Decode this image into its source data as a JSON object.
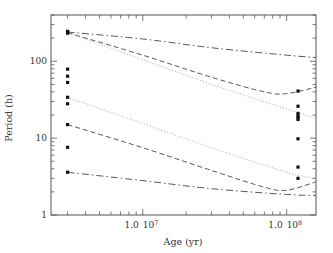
{
  "chart_data": {
    "type": "line",
    "title": "",
    "xlabel": "Age (yr)",
    "ylabel": "Period (h)",
    "xscale": "log",
    "yscale": "log",
    "xlim": [
      2300000,
      160000000
    ],
    "ylim": [
      1,
      400
    ],
    "grid": false,
    "legend": null,
    "x_tick_labels": [
      {
        "value": 10000000,
        "mantissa": "1.0",
        "base": "10",
        "exp": "7"
      },
      {
        "value": 100000000,
        "mantissa": "1.0",
        "base": "10",
        "exp": "8"
      }
    ],
    "y_tick_labels": [
      {
        "value": 1,
        "label": "1"
      },
      {
        "value": 10,
        "label": "10"
      },
      {
        "value": 100,
        "label": "100"
      }
    ],
    "series": [
      {
        "name": "upper-dashdot",
        "style": "dashdot",
        "x": [
          3000000,
          10000000,
          30000000,
          100000000,
          160000000
        ],
        "y": [
          240,
          195,
          150,
          120,
          112
        ]
      },
      {
        "name": "upper-dashed",
        "style": "dashed",
        "x": [
          3000000,
          10000000,
          30000000,
          70000000,
          100000000,
          160000000
        ],
        "y": [
          235,
          120,
          62,
          40,
          38,
          46
        ]
      },
      {
        "name": "upper-dotted",
        "style": "dotted",
        "x": [
          3000000,
          10000000,
          30000000,
          100000000,
          160000000
        ],
        "y": [
          235,
          105,
          50,
          24,
          18
        ]
      },
      {
        "name": "lower-dotted",
        "style": "dotted",
        "x": [
          3000000,
          10000000,
          30000000,
          100000000,
          130000000,
          160000000
        ],
        "y": [
          34,
          15.5,
          7.5,
          3.6,
          3.2,
          3.0
        ]
      },
      {
        "name": "lower-dashed",
        "style": "dashed",
        "x": [
          3000000,
          10000000,
          30000000,
          70000000,
          100000000,
          160000000
        ],
        "y": [
          15,
          7.5,
          3.8,
          2.3,
          2.1,
          2.7
        ]
      },
      {
        "name": "lower-dashdot",
        "style": "dashdot",
        "x": [
          3000000,
          10000000,
          30000000,
          100000000,
          160000000
        ],
        "y": [
          3.6,
          2.8,
          2.2,
          1.85,
          1.8
        ]
      }
    ],
    "points": {
      "young_cluster": {
        "age": 3000000,
        "periods": [
          245,
          238,
          232,
          79,
          64,
          53,
          34,
          28,
          15,
          7.6,
          3.6
        ]
      },
      "old_cluster": {
        "age": 120000000,
        "periods": [
          41,
          26,
          21,
          19.5,
          18.5,
          17.5,
          9.8,
          4.2,
          3.0
        ]
      }
    }
  },
  "axes": {
    "x_label": "Age (yr)",
    "y_label": "Period (h)"
  }
}
